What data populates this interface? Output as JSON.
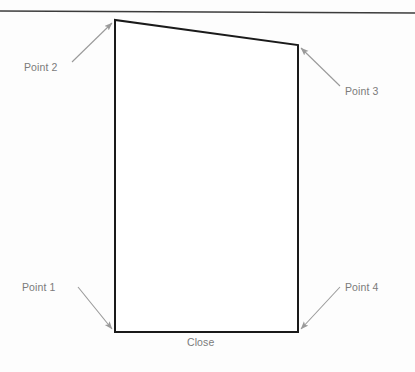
{
  "diagram": {
    "background_color": "#fdfdfd",
    "shape_stroke_color": "#1a1a1a",
    "annotation_color": "#9a9a9a",
    "label_text_color": "#7b7b7b",
    "top_rule": {
      "name": "top-horizontal-rule",
      "x1": 0,
      "y1": 11,
      "x2": 415,
      "y2": 13,
      "color": "#3c3c3c"
    },
    "shape": {
      "name": "quadrilateral",
      "points": [
        {
          "id": "point-1",
          "role": "bottom-left",
          "x": 115,
          "y": 332
        },
        {
          "id": "point-2",
          "role": "top-left",
          "x": 115,
          "y": 20
        },
        {
          "id": "point-3",
          "role": "top-right",
          "x": 298,
          "y": 45
        },
        {
          "id": "point-4",
          "role": "bottom-right",
          "x": 298,
          "y": 332
        }
      ],
      "stroke_width": 2
    },
    "labels": {
      "point_1": "Point 1",
      "point_2": "Point 2",
      "point_3": "Point 3",
      "point_4": "Point 4",
      "close": "Close"
    },
    "leader_lines": [
      {
        "name": "leader-point-1",
        "from_x": 78,
        "from_y": 287,
        "to_x": 112,
        "to_y": 329,
        "arrow": "end"
      },
      {
        "name": "leader-point-2",
        "from_x": 72,
        "from_y": 62,
        "to_x": 112,
        "to_y": 23,
        "arrow": "end"
      },
      {
        "name": "leader-point-3",
        "from_x": 340,
        "from_y": 86,
        "to_x": 301,
        "to_y": 48,
        "arrow": "end"
      },
      {
        "name": "leader-point-4",
        "from_x": 340,
        "from_y": 287,
        "to_x": 301,
        "to_y": 329,
        "arrow": "end"
      }
    ]
  }
}
